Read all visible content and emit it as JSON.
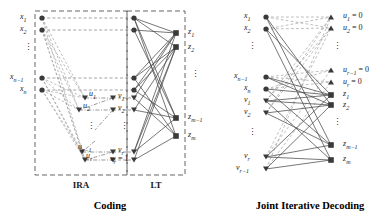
{
  "figure": {
    "left_panel": {
      "caption_ira": "IRA",
      "caption_lt": "LT",
      "title": "Coding",
      "left_nodes": [
        {
          "label": "x",
          "sub": "1"
        },
        {
          "label": "x",
          "sub": "2"
        },
        {
          "label": "x",
          "sub": "n−1"
        },
        {
          "label": "x",
          "sub": "n"
        }
      ],
      "mid_u_nodes": [
        {
          "label": "u",
          "sub": "1"
        },
        {
          "label": "u",
          "sub": "2"
        },
        {
          "label": "u",
          "sub": "r−1"
        },
        {
          "label": "u",
          "sub": "r"
        }
      ],
      "mid_v_nodes": [
        {
          "label": "v",
          "sub": "1"
        },
        {
          "label": "v",
          "sub": "2"
        },
        {
          "label": "v",
          "sub": "r"
        },
        {
          "label": "v",
          "sub": "r",
          "suffix": " = 1"
        }
      ],
      "right_nodes": [
        {
          "label": "z",
          "sub": "1"
        },
        {
          "label": "z",
          "sub": "2"
        },
        {
          "label": "z",
          "sub": "m−1"
        },
        {
          "label": "z",
          "sub": "m"
        }
      ]
    },
    "right_panel": {
      "title": "Joint Iterative Decoding",
      "left_nodes": [
        {
          "label": "x",
          "sub": "1"
        },
        {
          "label": "x",
          "sub": "2"
        },
        {
          "label": "x",
          "sub": "n−1"
        },
        {
          "label": "x",
          "sub": "n"
        },
        {
          "label": "v",
          "sub": "1"
        },
        {
          "label": "v",
          "sub": "2"
        },
        {
          "label": "v",
          "sub": "r"
        },
        {
          "label": "v",
          "sub": "r−1"
        }
      ],
      "right_nodes": [
        {
          "label": "u",
          "sub": "1",
          "suffix": " = 0"
        },
        {
          "label": "u",
          "sub": "2",
          "suffix": " = 0"
        },
        {
          "label": "u",
          "sub": "r−1",
          "suffix": " = 0"
        },
        {
          "label": "u",
          "sub": "r",
          "suffix": " = 0"
        },
        {
          "label": "z",
          "sub": "1"
        },
        {
          "label": "z",
          "sub": "2"
        },
        {
          "label": "z",
          "sub": "m−1"
        },
        {
          "label": "z",
          "sub": "m"
        }
      ]
    },
    "colors": {
      "node_fill": "#3a3a3a",
      "edge_solid": "#4a4a4a",
      "edge_dashed": "#8a8a8a",
      "box_dashed": "#555555",
      "text": "#1a1a1a"
    },
    "ellipsis_glyph": "⋮"
  }
}
